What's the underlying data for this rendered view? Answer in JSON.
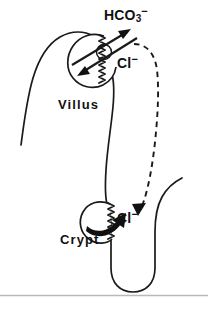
{
  "figure": {
    "name": "intestinal-chloride-recirculation-diagram",
    "background_color": "#ffffff",
    "ink_color": "#1a1a1a",
    "rule_color": "#b9b9b9",
    "width": 208,
    "height": 309
  },
  "labels": {
    "bicarbonate": {
      "text": "HCO",
      "subscript": "3",
      "superscript": "−",
      "full": "HCO3-"
    },
    "chloride_villus": {
      "text": "Cl",
      "superscript": "−",
      "full": "Cl-"
    },
    "chloride_crypt": {
      "text": "Cl",
      "superscript": "−",
      "full": "Cl-"
    },
    "villus": "Villus",
    "crypt": "Crypt"
  },
  "elements": {
    "villus_outline": "villus-epithelium-outline",
    "villus_cell": "villus-enterocyte-cell",
    "villus_brush_border": "villus-brush-border",
    "exchanger": "cl-hco3-exchanger-circle",
    "arrow_hco3_out": "hco3-efflux-arrow",
    "arrow_cl_in": "cl-influx-arrow",
    "crypt_outline": "crypt-lumen-outline",
    "crypt_cell": "crypt-cell",
    "crypt_brush_border": "crypt-brush-border",
    "arrow_cl_secretion": "cl-secretion-arrow",
    "recirculation_path": "cl-recirculation-dashed-arrow",
    "bottom_rule": "figure-bottom-rule"
  }
}
